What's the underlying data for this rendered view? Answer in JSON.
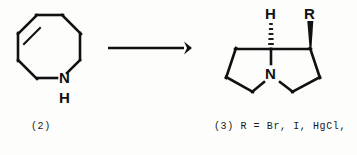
{
  "diagram": {
    "type": "chemical-reaction-scheme",
    "background_color": "#fdfdfc",
    "line_color": "#111111"
  },
  "reactant": {
    "name": "hexahydroazocine",
    "ring_size": 8,
    "label": "(2)",
    "atoms": {
      "nitrogen": "N",
      "nh_hydrogen": "H"
    },
    "bonds": {
      "double_bond_position": "upper-left ring edge"
    }
  },
  "arrow": {
    "name": "reaction-arrow",
    "direction": "right"
  },
  "product": {
    "name": "pyrrolizidine",
    "label_text": "(3) R = Br, I, HgCl,",
    "atoms": {
      "nitrogen": "N",
      "bridgehead_hydrogen": "H",
      "substituent": "R"
    },
    "stereochemistry": {
      "hydrogen_bond": "hashed-wedge",
      "substituent_bond": "solid-wedge"
    },
    "r_group_values": [
      "Br",
      "I",
      "HgCl"
    ]
  }
}
